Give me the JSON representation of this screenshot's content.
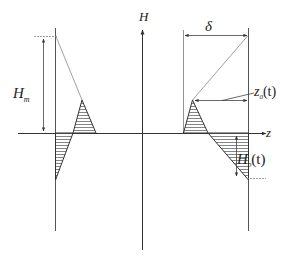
{
  "diagram": {
    "axes": {
      "vertical_label": "H",
      "horizontal_label": "z"
    },
    "labels": {
      "H_m": "H",
      "H_m_sub": "m",
      "delta": "δ",
      "z0_main": "z",
      "z0_sub": "0",
      "z0_args": "(t)",
      "H0_main": "H",
      "H0_sub": "0",
      "H0_args": "(t)"
    },
    "colors": {
      "line": "#555555",
      "axis": "#333333",
      "hatch": "#666666",
      "guide": "#888888"
    }
  }
}
